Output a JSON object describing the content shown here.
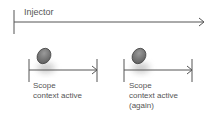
{
  "diagram": {
    "injector": {
      "label": "Injector"
    },
    "scopes": [
      {
        "line1": "Scope",
        "line2": "context active",
        "line3": ""
      },
      {
        "line1": "Scope",
        "line2": "context active",
        "line3": "(again)"
      }
    ],
    "colors": {
      "line": "#444444",
      "ellipse": "#7a7a7a",
      "text": "#555555"
    }
  }
}
